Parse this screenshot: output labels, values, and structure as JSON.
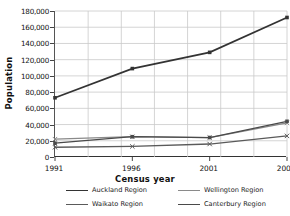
{
  "chart_data": {
    "type": "line",
    "title": "",
    "xlabel": "Census year",
    "ylabel": "Population",
    "categories": [
      "1991",
      "1996",
      "2001",
      "2006"
    ],
    "x": [
      1991,
      1996,
      2001,
      2006
    ],
    "ylim": [
      0,
      180000
    ],
    "yticks": [
      0,
      20000,
      40000,
      60000,
      80000,
      100000,
      120000,
      140000,
      160000,
      180000
    ],
    "ytick_labels": [
      "0",
      "20,000",
      "40,000",
      "60,000",
      "80,000",
      "100,000",
      "120,000",
      "140,000",
      "160,000",
      "180,000"
    ],
    "grid": true,
    "legend_position": "bottom",
    "series": [
      {
        "name": "Auckland Region",
        "values": [
          73000,
          109000,
          129000,
          172000
        ],
        "color": "#333333",
        "marker": "square"
      },
      {
        "name": "Wellington Region",
        "values": [
          22000,
          25000,
          24000,
          42000
        ],
        "color": "#8a8a8a",
        "marker": "cross"
      },
      {
        "name": "Waikato Region",
        "values": [
          12000,
          13000,
          16000,
          26000
        ],
        "color": "#5a5a5a",
        "marker": "cross"
      },
      {
        "name": "Canterbury Region",
        "values": [
          17000,
          25000,
          24000,
          44000
        ],
        "color": "#4a4a4a",
        "marker": "square"
      }
    ]
  },
  "axes": {
    "x_title": "Census year",
    "y_title": "Population"
  },
  "legend": {
    "entries": [
      {
        "label": "Auckland Region"
      },
      {
        "label": "Wellington Region"
      },
      {
        "label": "Waikato Region"
      },
      {
        "label": "Canterbury Region"
      }
    ]
  }
}
